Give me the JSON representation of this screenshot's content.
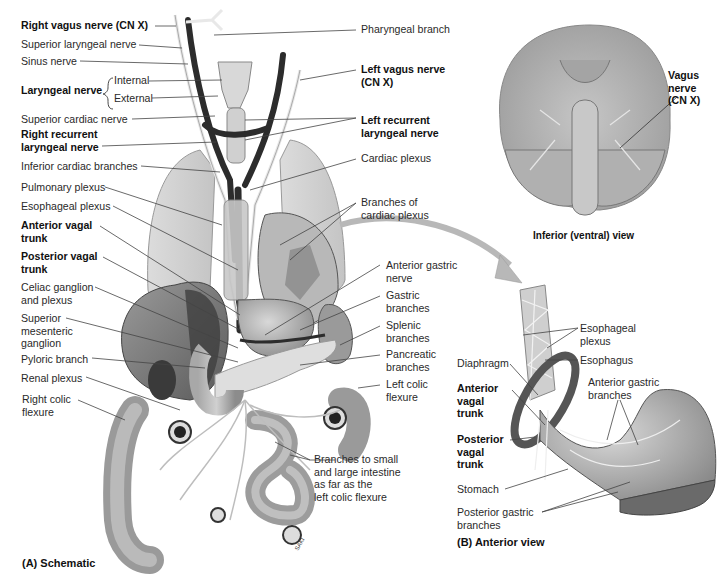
{
  "figure": {
    "panel_a_caption": "(A) Schematic",
    "panel_b_caption": "(B) Anterior view",
    "inset_caption": "Inferior (ventral) view"
  },
  "labels_left": {
    "right_vagus": "Right vagus nerve (CN X)",
    "superior_laryngeal": "Superior laryngeal nerve",
    "sinus_nerve": "Sinus nerve",
    "laryngeal_nerve": "Laryngeal nerve",
    "internal": "Internal",
    "external": "External",
    "superior_cardiac": "Superior cardiac nerve",
    "right_recurrent_1": "Right recurrent",
    "right_recurrent_2": "laryngeal nerve",
    "inferior_cardiac": "Inferior cardiac branches",
    "pulmonary_plexus": "Pulmonary plexus",
    "esophageal_plexus": "Esophageal plexus",
    "anterior_vagal_1": "Anterior vagal",
    "anterior_vagal_2": "trunk",
    "posterior_vagal_1": "Posterior vagal",
    "posterior_vagal_2": "trunk",
    "celiac_1": "Celiac ganglion",
    "celiac_2": "and plexus",
    "sup_mes_1": "Superior",
    "sup_mes_2": "mesenteric",
    "sup_mes_3": "ganglion",
    "pyloric_branch": "Pyloric branch",
    "renal_plexus": "Renal plexus",
    "right_colic_1": "Right colic",
    "right_colic_2": "flexure"
  },
  "labels_right": {
    "pharyngeal_branch": "Pharyngeal branch",
    "left_vagus_1": "Left vagus nerve",
    "left_vagus_2": "(CN X)",
    "left_recurrent_1": "Left recurrent",
    "left_recurrent_2": "laryngeal nerve",
    "cardiac_plexus": "Cardiac plexus",
    "branches_cardiac_1": "Branches of",
    "branches_cardiac_2": "cardiac plexus",
    "anterior_gastric_1": "Anterior gastric",
    "anterior_gastric_2": "nerve",
    "gastric_1": "Gastric",
    "gastric_2": "branches",
    "splenic_1": "Splenic",
    "splenic_2": "branches",
    "pancreatic_1": "Pancreatic",
    "pancreatic_2": "branches",
    "left_colic_1": "Left colic",
    "left_colic_2": "flexure",
    "intestine_1": "Branches to small",
    "intestine_2": "and large intestine",
    "intestine_3": "as far as the",
    "intestine_4": "left colic flexure"
  },
  "inset": {
    "vagus_1": "Vagus",
    "vagus_2": "nerve",
    "vagus_3": "(CN X)"
  },
  "panel_b": {
    "esophageal_plexus_1": "Esophageal",
    "esophageal_plexus_2": "plexus",
    "esophagus": "Esophagus",
    "diaphragm": "Diaphragm",
    "anterior_gastric_1": "Anterior gastric",
    "anterior_gastric_2": "branches",
    "anterior_vagal_1": "Anterior",
    "anterior_vagal_2": "vagal",
    "anterior_vagal_3": "trunk",
    "posterior_vagal_1": "Posterior",
    "posterior_vagal_2": "vagal",
    "posterior_vagal_3": "trunk",
    "stomach": "Stomach",
    "posterior_gastric_1": "Posterior gastric",
    "posterior_gastric_2": "branches"
  },
  "artist_signature": "SAKI"
}
